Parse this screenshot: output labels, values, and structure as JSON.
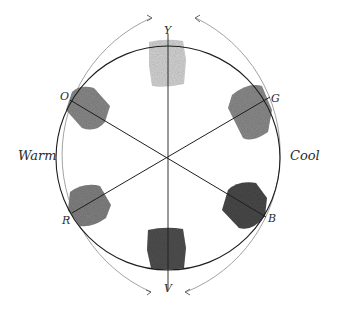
{
  "diagram": {
    "side_labels": {
      "left": "Warm",
      "right": "Cool"
    },
    "axis_labels": {
      "top": "Y",
      "bottom": "V",
      "upper_left": "O",
      "upper_right": "G",
      "lower_left": "R",
      "lower_right": "B"
    },
    "swatches": [
      {
        "name": "yellow",
        "label": "Y",
        "value_gray": "#d6d6d6"
      },
      {
        "name": "green",
        "label": "G",
        "value_gray": "#8c8c8c"
      },
      {
        "name": "blue",
        "label": "B",
        "value_gray": "#4a4a4a"
      },
      {
        "name": "violet",
        "label": "V",
        "value_gray": "#505050"
      },
      {
        "name": "red",
        "label": "R",
        "value_gray": "#828282"
      },
      {
        "name": "orange",
        "label": "O",
        "value_gray": "#8a8a8a"
      }
    ],
    "colors": {
      "ink": "#1e1e1e",
      "arc_ink": "#8a8a8a",
      "paper": "#ffffff"
    }
  }
}
